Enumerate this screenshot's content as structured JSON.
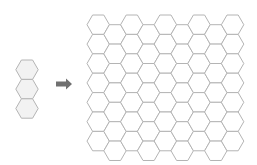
{
  "diagram": {
    "colors": {
      "background": "#ffffff",
      "stroke": "#b4b4b4",
      "source_fill": "#f2f2f2",
      "grid_fill": "#ffffff",
      "arrow": "#707070"
    },
    "source_stack": {
      "count": 3,
      "center_x": 27,
      "top_y": 60,
      "side": 11.2
    },
    "arrow": {
      "x": 56,
      "y": 84,
      "length": 16,
      "direction": "right"
    },
    "grid": {
      "columns": 9,
      "rows_per_column": 7,
      "origin_x": 87,
      "origin_y": 15,
      "side": 11.2,
      "orientation": "flat-top"
    }
  }
}
